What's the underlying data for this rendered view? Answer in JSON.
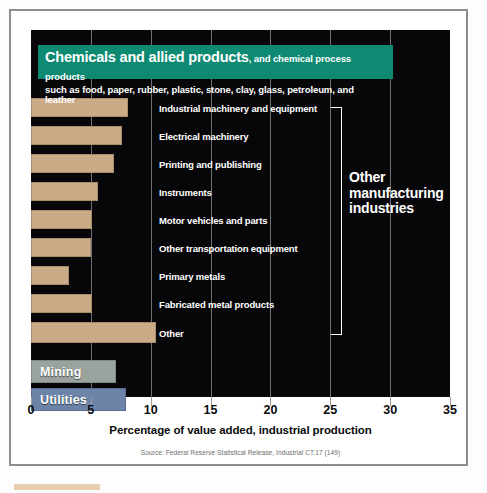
{
  "banner": {
    "strong": "Chemicals and allied products",
    "rest": ", and chemical process products",
    "line2": "such as food, paper, rubber, plastic, stone, clay, glass, petroleum, and leather"
  },
  "annotations": {
    "other_manufacturing_line1": "Other",
    "other_manufacturing_line2": "manufacturing",
    "other_manufacturing_line3": "industries"
  },
  "axis": {
    "title": "Percentage of value added, industrial production",
    "ticks": [
      "0",
      "5",
      "10",
      "15",
      "20",
      "25",
      "30",
      "35"
    ]
  },
  "source": "Source: Federal Reserve Statistical Release, Industrial CT.17 (149)",
  "colors": {
    "banner_teal": "#0e8a72",
    "bar_tan": "#c9ab87",
    "bar_mining_gray": "#9aa39e",
    "bar_utilities_blue": "#6d84a8",
    "plot_background": "#07070a",
    "label_white": "#ffffff"
  },
  "chart_data": {
    "type": "bar",
    "orientation": "horizontal",
    "title": "Chemicals and allied products, and chemical process products such as food, paper, rubber, plastic, stone, clay, glass, petroleum, and leather",
    "xlabel": "Percentage of value added, industrial production",
    "ylabel": "",
    "xlim": [
      0,
      35
    ],
    "xticks": [
      0,
      5,
      10,
      15,
      20,
      25,
      30,
      35
    ],
    "grid": true,
    "legend": false,
    "categories": [
      "Industrial machinery and equipment",
      "Electrical machinery",
      "Printing and publishing",
      "Instruments",
      "Motor vehicles and parts",
      "Other transportation equipment",
      "Primary metals",
      "Fabricated metal products",
      "Other",
      "Mining",
      "Utilities"
    ],
    "values": [
      8.1,
      7.6,
      6.9,
      5.6,
      5.1,
      5.0,
      3.2,
      5.1,
      10.4,
      7.1,
      7.9
    ],
    "bars": [
      {
        "label": "Industrial machinery and equipment",
        "value": 8.1,
        "color": "#c9ab87",
        "label_position": "outside"
      },
      {
        "label": "Electrical machinery",
        "value": 7.6,
        "color": "#c9ab87",
        "label_position": "outside"
      },
      {
        "label": "Printing and publishing",
        "value": 6.9,
        "color": "#c9ab87",
        "label_position": "outside"
      },
      {
        "label": "Instruments",
        "value": 5.6,
        "color": "#c9ab87",
        "label_position": "outside"
      },
      {
        "label": "Motor vehicles and parts",
        "value": 5.1,
        "color": "#c9ab87",
        "label_position": "outside"
      },
      {
        "label": "Other transportation equipment",
        "value": 5.0,
        "color": "#c9ab87",
        "label_position": "outside"
      },
      {
        "label": "Primary metals",
        "value": 3.2,
        "color": "#c9ab87",
        "label_position": "outside"
      },
      {
        "label": "Fabricated metal products",
        "value": 5.1,
        "color": "#c9ab87",
        "label_position": "outside"
      },
      {
        "label": "Other",
        "value": 10.4,
        "color": "#c9ab87",
        "label_position": "outside"
      },
      {
        "label": "Mining",
        "value": 7.1,
        "color": "#9aa39e",
        "label_position": "inside"
      },
      {
        "label": "Utilities",
        "value": 7.9,
        "color": "#6d84a8",
        "label_position": "inside"
      }
    ],
    "annotation": "Other manufacturing industries",
    "source": "Source: Federal Reserve Statistical Release, Industrial CT.17 (149)"
  }
}
